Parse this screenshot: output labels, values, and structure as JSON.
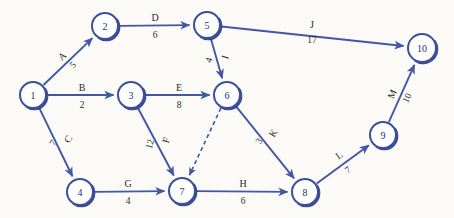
{
  "diagram": {
    "type": "directed-network",
    "background_color": "#fbfaf7",
    "node_stroke_color": "#3a4fa0",
    "edge_color": "#4257a5",
    "label_color": "#2a2a2a"
  },
  "chart_data": {
    "type": "diagram",
    "nodes": [
      {
        "id": "1",
        "label": "1",
        "x": 33,
        "y": 95,
        "r": 13
      },
      {
        "id": "2",
        "label": "2",
        "x": 105,
        "y": 26,
        "r": 13
      },
      {
        "id": "3",
        "label": "3",
        "x": 131,
        "y": 95,
        "r": 13
      },
      {
        "id": "4",
        "label": "4",
        "x": 80,
        "y": 192,
        "r": 13
      },
      {
        "id": "5",
        "label": "5",
        "x": 207,
        "y": 25,
        "r": 13
      },
      {
        "id": "6",
        "label": "6",
        "x": 227,
        "y": 95,
        "r": 13
      },
      {
        "id": "7",
        "label": "7",
        "x": 182,
        "y": 191,
        "r": 13
      },
      {
        "id": "8",
        "label": "8",
        "x": 305,
        "y": 192,
        "r": 13
      },
      {
        "id": "9",
        "label": "9",
        "x": 383,
        "y": 135,
        "r": 13
      },
      {
        "id": "10",
        "label": "10",
        "x": 422,
        "y": 48,
        "r": 14
      }
    ],
    "edges": [
      {
        "name": "A",
        "value": "5",
        "from": "1",
        "to": "2",
        "style": "solid",
        "name_x": 62,
        "name_y": 56,
        "name_rot": -43,
        "val_x": 73,
        "val_y": 65,
        "val_rot": -43
      },
      {
        "name": "B",
        "value": "2",
        "from": "1",
        "to": "3",
        "style": "solid",
        "name_x": 82,
        "name_y": 87,
        "name_rot": 0,
        "val_x": 82,
        "val_y": 105,
        "val_rot": 0
      },
      {
        "name": "C",
        "value": "7",
        "from": "1",
        "to": "4",
        "style": "solid",
        "name_x": 68,
        "name_y": 139,
        "name_rot": -58,
        "val_x": 53,
        "val_y": 143,
        "val_rot": -58
      },
      {
        "name": "D",
        "value": "6",
        "from": "2",
        "to": "5",
        "style": "solid",
        "name_x": 155,
        "name_y": 17,
        "name_rot": 0,
        "val_x": 155,
        "val_y": 35,
        "val_rot": 0
      },
      {
        "name": "E",
        "value": "8",
        "from": "3",
        "to": "6",
        "style": "solid",
        "name_x": 179,
        "name_y": 87,
        "name_rot": 0,
        "val_x": 179,
        "val_y": 105,
        "val_rot": 0
      },
      {
        "name": "F",
        "value": "12",
        "from": "3",
        "to": "7",
        "style": "solid",
        "name_x": 166,
        "name_y": 140,
        "name_rot": -73,
        "val_x": 150,
        "val_y": 144,
        "val_rot": -73
      },
      {
        "name": "G",
        "value": "4",
        "from": "4",
        "to": "7",
        "style": "solid",
        "name_x": 128,
        "name_y": 183,
        "name_rot": 0,
        "val_x": 128,
        "val_y": 201,
        "val_rot": 0
      },
      {
        "name": "H",
        "value": "6",
        "from": "7",
        "to": "8",
        "style": "solid",
        "name_x": 243,
        "name_y": 183,
        "name_rot": 0,
        "val_x": 243,
        "val_y": 201,
        "val_rot": 0
      },
      {
        "name": "I",
        "value": "4",
        "from": "5",
        "to": "6",
        "style": "solid",
        "name_x": 225,
        "name_y": 57,
        "name_rot": -72,
        "val_x": 209,
        "val_y": 60,
        "val_rot": -72
      },
      {
        "name": "J",
        "value": "17",
        "from": "5",
        "to": "10",
        "style": "solid",
        "name_x": 312,
        "name_y": 24,
        "name_rot": 0,
        "val_x": 312,
        "val_y": 40,
        "val_rot": 0
      },
      {
        "name": "K",
        "value": "3",
        "from": "6",
        "to": "8",
        "style": "solid",
        "name_x": 273,
        "name_y": 133,
        "name_rot": -57,
        "val_x": 259,
        "val_y": 141,
        "val_rot": -57
      },
      {
        "name": "L",
        "value": "7",
        "from": "8",
        "to": "9",
        "style": "solid",
        "name_x": 339,
        "name_y": 155,
        "name_rot": -36,
        "val_x": 348,
        "val_y": 170,
        "val_rot": -36
      },
      {
        "name": "M",
        "value": "10",
        "from": "9",
        "to": "10",
        "style": "solid",
        "name_x": 392,
        "name_y": 94,
        "name_rot": -65,
        "val_x": 407,
        "val_y": 98,
        "val_rot": -65
      },
      {
        "name": "",
        "value": "",
        "from": "6",
        "to": "7",
        "style": "dashed",
        "name_x": 0,
        "name_y": 0,
        "name_rot": 0,
        "val_x": 0,
        "val_y": 0,
        "val_rot": 0
      }
    ]
  }
}
